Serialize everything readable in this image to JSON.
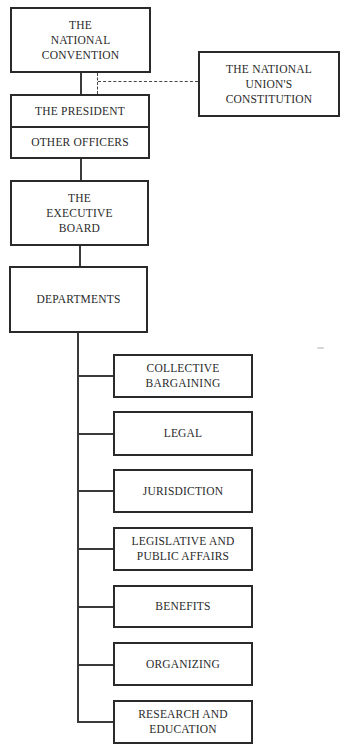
{
  "chart": {
    "type": "organizational-chart",
    "top": {
      "convention": "THE\nNATIONAL\nCONVENTION",
      "constitution": "THE NATIONAL\nUNION'S\nCONSTITUTION",
      "president": "THE PRESIDENT",
      "other_officers": "OTHER OFFICERS",
      "executive_board": "THE\nEXECUTIVE\nBOARD",
      "departments": "DEPARTMENTS"
    },
    "departments": [
      {
        "label": "COLLECTIVE\nBARGAINING"
      },
      {
        "label": "LEGAL"
      },
      {
        "label": "JURISDICTION"
      },
      {
        "label": "LEGISLATIVE AND\nPUBLIC AFFAIRS"
      },
      {
        "label": "BENEFITS"
      },
      {
        "label": "ORGANIZING"
      },
      {
        "label": "RESEARCH AND\nEDUCATION"
      }
    ],
    "colors": {
      "line": "#2a2a2a",
      "background": "#ffffff"
    }
  }
}
